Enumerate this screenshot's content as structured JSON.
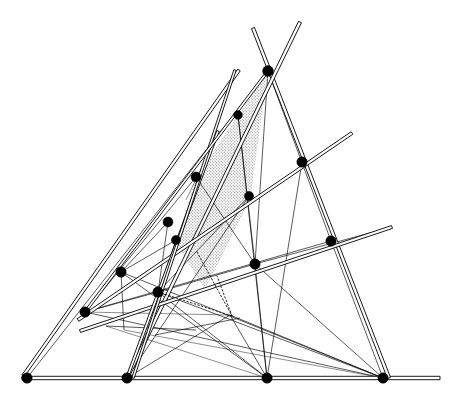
{
  "figure": {
    "type": "geometric-line-diagram",
    "canvas": {
      "width": 463,
      "height": 404
    },
    "background_color": "#ffffff",
    "line_color": "#000000",
    "node_color": "#000000",
    "shade_color": "#d9d9d9",
    "shade_pattern": "stipple-dots"
  },
  "nodes": [
    {
      "id": "P1",
      "x": 27,
      "y": 378,
      "r": 5.2,
      "label": "bottom-left-vertex"
    },
    {
      "id": "P2",
      "x": 127,
      "y": 378,
      "r": 5.2,
      "label": "bottom-second-point"
    },
    {
      "id": "P3",
      "x": 267,
      "y": 378,
      "r": 5.2,
      "label": "bottom-third-point"
    },
    {
      "id": "P4",
      "x": 383,
      "y": 378,
      "r": 5.2,
      "label": "bottom-right-vertex"
    },
    {
      "id": "P5",
      "x": 85,
      "y": 312,
      "r": 5.2,
      "label": "left-lower-node"
    },
    {
      "id": "P6",
      "x": 121,
      "y": 272,
      "r": 5.2,
      "label": "left-mid-node"
    },
    {
      "id": "P7",
      "x": 158,
      "y": 292,
      "r": 5.2,
      "label": "central-lower-node"
    },
    {
      "id": "P8",
      "x": 168,
      "y": 222,
      "r": 5.0,
      "label": "left-upper-node"
    },
    {
      "id": "P9",
      "x": 176,
      "y": 240,
      "r": 4.6,
      "label": "left-upper-inner-node"
    },
    {
      "id": "P10",
      "x": 196,
      "y": 177,
      "r": 5.0,
      "label": "upper-left-node"
    },
    {
      "id": "P11",
      "x": 238,
      "y": 115,
      "r": 4.4,
      "label": "upper-inner-node"
    },
    {
      "id": "P12",
      "x": 268,
      "y": 71,
      "r": 5.4,
      "label": "apex-crossing-node"
    },
    {
      "id": "P13",
      "x": 249,
      "y": 196,
      "r": 4.6,
      "label": "mid-right-node"
    },
    {
      "id": "P14",
      "x": 255,
      "y": 264,
      "r": 5.2,
      "label": "center-right-node"
    },
    {
      "id": "P15",
      "x": 302,
      "y": 162,
      "r": 5.2,
      "label": "right-upper-node"
    },
    {
      "id": "P16",
      "x": 331,
      "y": 241,
      "r": 5.2,
      "label": "right-mid-node"
    }
  ],
  "rods": [
    {
      "id": "R1",
      "name": "baseline-rod",
      "x1": 22,
      "y1": 378,
      "x2": 440,
      "y2": 378,
      "w": 3.4
    },
    {
      "id": "R2",
      "name": "left-long-rod",
      "x1": 23,
      "y1": 376,
      "x2": 239,
      "y2": 70,
      "w": 3.0
    },
    {
      "id": "R3",
      "name": "right-long-rod",
      "x1": 389,
      "y1": 378,
      "x2": 253,
      "y2": 28,
      "w": 3.2
    },
    {
      "id": "R4",
      "name": "apex-right-rod",
      "x1": 127,
      "y1": 378,
      "x2": 300,
      "y2": 22,
      "w": 3.2
    },
    {
      "id": "R5",
      "name": "upper-transversal",
      "x1": 78,
      "y1": 320,
      "x2": 352,
      "y2": 133,
      "w": 3.0
    },
    {
      "id": "R6",
      "name": "lower-transversal",
      "x1": 80,
      "y1": 331,
      "x2": 392,
      "y2": 227,
      "w": 3.0
    },
    {
      "id": "R7",
      "name": "steep-left-rod",
      "x1": 127,
      "y1": 378,
      "x2": 218,
      "y2": 131,
      "w": 2.6
    },
    {
      "id": "R8",
      "name": "inner-steep-rod",
      "x1": 133,
      "y1": 378,
      "x2": 235,
      "y2": 70,
      "w": 2.4
    },
    {
      "id": "R9",
      "name": "diagonal-rod",
      "x1": 85,
      "y1": 312,
      "x2": 268,
      "y2": 71,
      "w": 2.4
    }
  ],
  "thin_lines": [
    {
      "id": "T1",
      "name": "base-to-apex-left",
      "x1": 27,
      "y1": 378,
      "x2": 268,
      "y2": 71
    },
    {
      "id": "T2",
      "name": "node5-to-node16",
      "x1": 85,
      "y1": 312,
      "x2": 331,
      "y2": 241
    },
    {
      "id": "T3",
      "name": "node5-to-node4",
      "x1": 85,
      "y1": 312,
      "x2": 383,
      "y2": 378
    },
    {
      "id": "T4",
      "name": "node6-to-node3",
      "x1": 121,
      "y1": 272,
      "x2": 267,
      "y2": 378
    },
    {
      "id": "T5",
      "name": "node6-to-node4",
      "x1": 121,
      "y1": 272,
      "x2": 383,
      "y2": 378
    },
    {
      "id": "T6",
      "name": "node7-to-node4",
      "x1": 158,
      "y1": 292,
      "x2": 383,
      "y2": 378
    },
    {
      "id": "T7",
      "name": "node7-to-node3",
      "x1": 158,
      "y1": 292,
      "x2": 267,
      "y2": 378
    },
    {
      "id": "T8",
      "name": "node7-to-node14",
      "x1": 158,
      "y1": 292,
      "x2": 255,
      "y2": 264
    },
    {
      "id": "T9",
      "name": "node14-to-node12",
      "x1": 255,
      "y1": 264,
      "x2": 268,
      "y2": 71
    },
    {
      "id": "T10",
      "name": "node14-to-node3",
      "x1": 255,
      "y1": 264,
      "x2": 267,
      "y2": 378
    },
    {
      "id": "T11",
      "name": "node13-to-node7",
      "x1": 249,
      "y1": 196,
      "x2": 158,
      "y2": 292
    },
    {
      "id": "T12",
      "name": "node10-to-node14",
      "x1": 196,
      "y1": 177,
      "x2": 255,
      "y2": 264
    },
    {
      "id": "T13",
      "name": "node6-vertical-drop",
      "x1": 121,
      "y1": 272,
      "x2": 124,
      "y2": 330
    },
    {
      "id": "T14",
      "name": "short-horizontal-left",
      "x1": 106,
      "y1": 326,
      "x2": 196,
      "y2": 330
    },
    {
      "id": "T15",
      "name": "short-horizontal-mid",
      "x1": 155,
      "y1": 335,
      "x2": 240,
      "y2": 318
    },
    {
      "id": "T16",
      "name": "node-fan-to-base-3",
      "x1": 230,
      "y1": 315,
      "x2": 267,
      "y2": 378
    },
    {
      "id": "T17",
      "name": "node-fan-to-base-4",
      "x1": 230,
      "y1": 315,
      "x2": 383,
      "y2": 378
    },
    {
      "id": "T18",
      "name": "node-fan-to-node2",
      "x1": 230,
      "y1": 315,
      "x2": 127,
      "y2": 378
    },
    {
      "id": "T19",
      "name": "node8-to-node7",
      "x1": 168,
      "y1": 222,
      "x2": 158,
      "y2": 292
    },
    {
      "id": "T20",
      "name": "node9-to-node7",
      "x1": 176,
      "y1": 240,
      "x2": 158,
      "y2": 292
    },
    {
      "id": "T21",
      "name": "node6-to-node9",
      "x1": 121,
      "y1": 272,
      "x2": 176,
      "y2": 240
    },
    {
      "id": "T22",
      "name": "node6-to-node8",
      "x1": 121,
      "y1": 272,
      "x2": 168,
      "y2": 222
    },
    {
      "id": "T23",
      "name": "node11-to-node14",
      "x1": 238,
      "y1": 115,
      "x2": 255,
      "y2": 264
    },
    {
      "id": "T24",
      "name": "node14-long-right",
      "x1": 255,
      "y1": 264,
      "x2": 392,
      "y2": 227
    },
    {
      "id": "T25",
      "name": "apex-to-node16",
      "x1": 268,
      "y1": 71,
      "x2": 331,
      "y2": 241
    },
    {
      "id": "T26",
      "name": "left-fan-upper",
      "x1": 85,
      "y1": 312,
      "x2": 196,
      "y2": 177
    },
    {
      "id": "T27",
      "name": "node5-to-node7",
      "x1": 85,
      "y1": 312,
      "x2": 158,
      "y2": 292
    },
    {
      "id": "T28",
      "name": "node2-to-node13",
      "x1": 127,
      "y1": 378,
      "x2": 249,
      "y2": 196
    },
    {
      "id": "T29",
      "name": "base-fan-node3-up",
      "x1": 267,
      "y1": 378,
      "x2": 238,
      "y2": 115
    },
    {
      "id": "T30",
      "name": "node4-to-node14-fan",
      "x1": 383,
      "y1": 378,
      "x2": 255,
      "y2": 264
    },
    {
      "id": "T31",
      "name": "node16-to-node4",
      "x1": 331,
      "y1": 241,
      "x2": 383,
      "y2": 378
    },
    {
      "id": "T32",
      "name": "node15-to-node3",
      "x1": 302,
      "y1": 162,
      "x2": 267,
      "y2": 378
    }
  ],
  "hair_lines": [
    {
      "id": "H1",
      "name": "faint-chord-left",
      "x1": 85,
      "y1": 312,
      "x2": 230,
      "y2": 315
    },
    {
      "id": "H2",
      "name": "faint-chord-base",
      "x1": 124,
      "y1": 330,
      "x2": 383,
      "y2": 378
    },
    {
      "id": "H3",
      "name": "faint-chord-mid",
      "x1": 106,
      "y1": 326,
      "x2": 267,
      "y2": 378
    },
    {
      "id": "H4",
      "name": "faint-upper-tick",
      "x1": 186,
      "y1": 200,
      "x2": 214,
      "y2": 142
    }
  ],
  "dotted_lines": [
    {
      "id": "D1",
      "name": "dotted-node7-to-focus",
      "x1": 158,
      "y1": 292,
      "x2": 232,
      "y2": 316
    },
    {
      "id": "D2",
      "name": "dotted-node10-to-focus",
      "x1": 197,
      "y1": 252,
      "x2": 232,
      "y2": 316
    },
    {
      "id": "D3",
      "name": "dotted-focus-upper",
      "x1": 232,
      "y1": 316,
      "x2": 217,
      "y2": 276
    }
  ],
  "shaded_region": {
    "name": "stippled-triangle",
    "points": "268,71 238,115 196,177 176,243 205,290 250,200",
    "fill": "#dedede",
    "opacity": 0.85
  },
  "rod_endpoints": [
    {
      "id": "E1",
      "x": 440,
      "y": 378,
      "name": "baseline-right-tip"
    },
    {
      "id": "E2",
      "x": 253,
      "y": 28,
      "name": "right-rod-top-tip"
    },
    {
      "id": "E3",
      "x": 300,
      "y": 22,
      "name": "apex-rod-top-tip"
    },
    {
      "id": "E4",
      "x": 239,
      "y": 70,
      "name": "left-rod-top-tip"
    },
    {
      "id": "E5",
      "x": 352,
      "y": 133,
      "name": "upper-transversal-right-tip"
    },
    {
      "id": "E6",
      "x": 392,
      "y": 227,
      "name": "lower-transversal-right-tip"
    },
    {
      "id": "E7",
      "x": 218,
      "y": 131,
      "name": "steep-rod-top-tip"
    },
    {
      "id": "E8",
      "x": 235,
      "y": 70,
      "name": "inner-steep-rod-top-tip"
    }
  ]
}
